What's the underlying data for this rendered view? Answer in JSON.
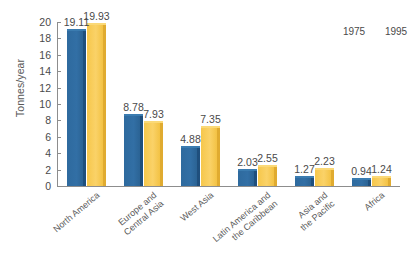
{
  "chart_data": {
    "type": "bar",
    "title": "",
    "xlabel": "",
    "ylabel": "Tonnes/year",
    "ylim": [
      0,
      20
    ],
    "ytick_step": 2,
    "yticks": [
      "20",
      "18",
      "16",
      "14",
      "12",
      "10",
      "8",
      "6",
      "4",
      "2",
      "0"
    ],
    "grid": false,
    "legend_position": "top-right",
    "categories": [
      "North America",
      "Europe and\nCentral Asia",
      "West Asia",
      "Latin America and\nthe Caribbean",
      "Asia and\nthe Pacific",
      "Africa"
    ],
    "series": [
      {
        "name": "1975",
        "color": "#2e6a9e",
        "values": [
          19.11,
          8.78,
          4.88,
          2.03,
          1.27,
          0.94
        ],
        "labels": [
          "19.11",
          "8.78",
          "4.88",
          "2.03",
          "1.27",
          "0.94"
        ]
      },
      {
        "name": "1995",
        "color": "#f7c94e",
        "values": [
          19.93,
          7.93,
          7.35,
          2.55,
          2.23,
          1.24
        ],
        "labels": [
          "19.93",
          "7.93",
          "7.35",
          "2.55",
          "2.23",
          "1.24"
        ]
      }
    ]
  },
  "legend": {
    "items": [
      {
        "label": "1975"
      },
      {
        "label": "1995"
      }
    ]
  },
  "colors": {
    "series_1975": "#2e6a9e",
    "series_1995": "#f7c94e",
    "axis": "#8d8d8d",
    "text": "#4a4a4a",
    "background": "#ffffff"
  }
}
